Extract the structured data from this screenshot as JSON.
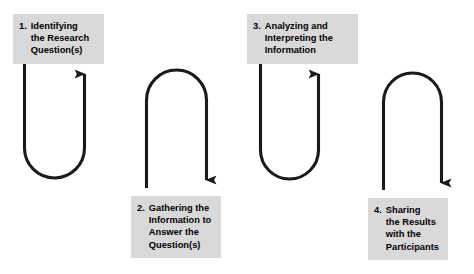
{
  "diagram": {
    "colors": {
      "label_background": "#d9d9d9",
      "text": "#000000",
      "stroke": "#1a1a1a",
      "page_background": "#ffffff"
    },
    "steps": [
      {
        "number": "1.",
        "text": "Identifying\nthe Research\nQuestion(s)",
        "position": "top-left"
      },
      {
        "number": "2.",
        "text": "Gathering the\nInformation to\nAnswer the\nQuestion(s)",
        "position": "bottom-left-center"
      },
      {
        "number": "3.",
        "text": "Analyzing and\nInterpreting the\nInformation",
        "position": "top-right-center"
      },
      {
        "number": "4.",
        "text": "Sharing\nthe Results\nwith the\nParticipants",
        "position": "bottom-right"
      }
    ],
    "connectors": [
      {
        "name": "u-turn-up-1",
        "shape": "u-shape-arrow-up",
        "description": "Descends on left, curves at bottom, rises on right with arrowhead pointing up into step 1"
      },
      {
        "name": "arch-down-1",
        "shape": "arch-arrow-down",
        "description": "Rises on left, arches over the top, descends on right with arrowhead pointing down into step 2"
      },
      {
        "name": "u-turn-up-2",
        "shape": "u-shape-arrow-up",
        "description": "Descends on left, curves at bottom, rises on right with arrowhead pointing up into step 3"
      },
      {
        "name": "arch-down-2",
        "shape": "arch-arrow-down",
        "description": "Rises on left, arches over the top, descends on right with arrowhead pointing down into step 4"
      }
    ]
  }
}
